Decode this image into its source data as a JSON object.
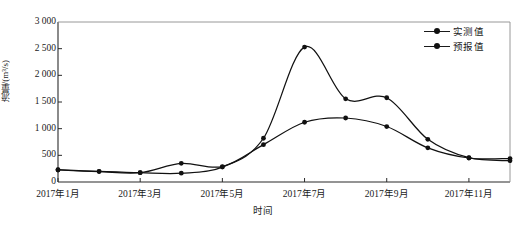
{
  "chart_data": {
    "type": "line",
    "title": "",
    "xlabel": "时间",
    "ylabel": "流量/(m³/s)",
    "ylim": [
      0,
      3000
    ],
    "ytick_values": [
      0,
      500,
      1000,
      1500,
      2000,
      2500,
      3000
    ],
    "ytick_labels": [
      "0",
      "500",
      "1 000",
      "1 500",
      "2 000",
      "2 500",
      "3 000"
    ],
    "grid": false,
    "legend_position": "top-right",
    "categories": [
      "2017年1月",
      "2017年2月",
      "2017年3月",
      "2017年4月",
      "2017年5月",
      "2017年6月",
      "2017年7月",
      "2017年8月",
      "2017年9月",
      "2017年10月",
      "2017年11月",
      "2017年12月"
    ],
    "xtick_labels": [
      "2017年1月",
      "2017年3月",
      "2017年5月",
      "2017年7月",
      "2017年9月",
      "2017年11月"
    ],
    "xtick_indices": [
      0,
      2,
      4,
      6,
      8,
      10
    ],
    "series": [
      {
        "name": "实测值",
        "color": "#111111",
        "marker": "circle",
        "values": [
          230,
          200,
          175,
          165,
          280,
          820,
          2530,
          1560,
          1580,
          800,
          455,
          400
        ]
      },
      {
        "name": "预报值",
        "color": "#111111",
        "marker": "circle",
        "values": [
          225,
          195,
          175,
          350,
          290,
          700,
          1120,
          1200,
          1040,
          640,
          450,
          440
        ]
      }
    ]
  },
  "legend": {
    "items": [
      {
        "label": "实测值"
      },
      {
        "label": "预报值"
      }
    ]
  },
  "caption": {
    "text": ""
  }
}
